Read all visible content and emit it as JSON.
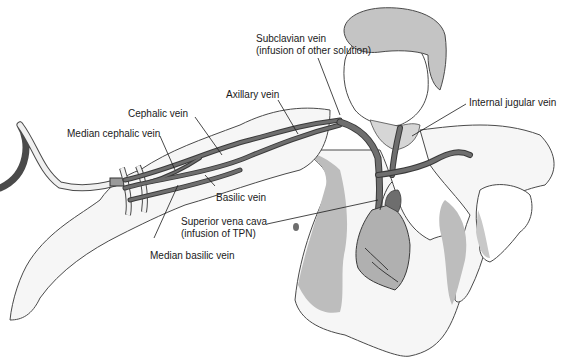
{
  "diagram": {
    "colors": {
      "background": "#ffffff",
      "vein": "#6e6e6e",
      "vein_outline": "#3a3a3a",
      "skin_shade": "#bdbdbd",
      "hair": "#c4c4c4",
      "heart": "#b0b0b0",
      "outline": "#4a4a4a",
      "label_text": "#1a1a1a"
    }
  },
  "labels": {
    "subclavian": {
      "line1": "Subclavian vein",
      "line2": "(infusion of other solution)"
    },
    "axillary": "Axillary vein",
    "cephalic": "Cephalic vein",
    "median_cephalic": "Median cephalic vein",
    "internal_jugular": "Internal jugular vein",
    "basilic": "Basilic vein",
    "svc": {
      "line1": "Superior vena cava",
      "line2": "(infusion of TPN)"
    },
    "median_basilic": "Median basilic vein"
  }
}
